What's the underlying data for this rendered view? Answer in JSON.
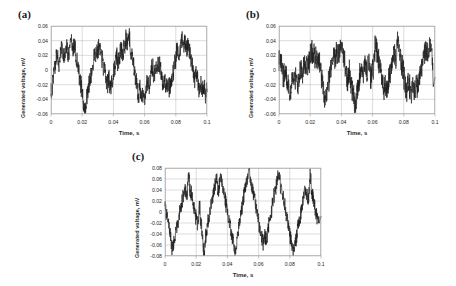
{
  "figure": {
    "background": "#ffffff",
    "line_color": "#1c1c1c",
    "grid_color": "#b8b8b8",
    "frame_color": "#9a9a9a",
    "text_color": "#2a2a2a"
  },
  "panels": [
    {
      "id": "a",
      "label": "(a)",
      "ylabel": "Generated voltage, mV",
      "xlabel": "Time, s",
      "yticks": [
        "0.06",
        "0.04",
        "0.02",
        "0",
        "-0.02",
        "-0.04",
        "-0.06"
      ],
      "xticks": [
        "0",
        "0.02",
        "0.04",
        "0.06",
        "0.08",
        "0.1"
      ]
    },
    {
      "id": "b",
      "label": "(b)",
      "ylabel": "Generated voltage, mV",
      "xlabel": "Time, s",
      "yticks": [
        "0.06",
        "0.04",
        "0.02",
        "0",
        "-0.02",
        "-0.04",
        "-0.06"
      ],
      "xticks": [
        "0",
        "0.02",
        "0.04",
        "0.06",
        "0.08",
        "0.1"
      ]
    },
    {
      "id": "c",
      "label": "(c)",
      "ylabel": "Generated voltage, mV",
      "xlabel": "Time, s",
      "yticks": [
        "0.08",
        "0.06",
        "0.04",
        "0.02",
        "0",
        "-0.02",
        "-0.04",
        "-0.06",
        "-0.08"
      ],
      "xticks": [
        "0",
        "0.02",
        "0.04",
        "0.06",
        "0.08",
        "0.1"
      ]
    }
  ],
  "chart_data": [
    {
      "type": "line",
      "panel": "a",
      "title": "(a)",
      "xlabel": "Time, s",
      "ylabel": "Generated voltage, mV",
      "xlim": [
        0,
        0.1
      ],
      "ylim": [
        -0.06,
        0.06
      ],
      "xticks": [
        0,
        0.02,
        0.04,
        0.06,
        0.08,
        0.1
      ],
      "yticks": [
        -0.06,
        -0.04,
        -0.02,
        0,
        0.02,
        0.04,
        0.06
      ],
      "grid": true,
      "legend": "none",
      "series": [
        {
          "name": "generated voltage",
          "description": "Noisy quasi-periodic waveform, about 7 cycles over 0.1 s (~70 Hz envelope), amplitude roughly +/-0.045 mV with high-frequency noise superimposed.",
          "sample_rate_hz": 2000,
          "envelope_frequency_hz": 70,
          "envelope_amplitude_mv": 0.026,
          "noise_amplitude_mv": 0.016,
          "peak_max_mv": 0.047,
          "peak_min_mv": -0.055,
          "x": [
            0.0,
            0.001,
            0.002,
            0.003,
            0.004,
            0.005,
            0.006,
            0.007,
            0.008,
            0.009,
            0.01,
            0.011,
            0.012,
            0.013,
            0.014,
            0.015,
            0.016,
            0.017,
            0.018,
            0.019,
            0.02,
            0.021,
            0.022,
            0.023,
            0.024,
            0.025,
            0.026,
            0.027,
            0.028,
            0.029,
            0.03,
            0.031,
            0.032,
            0.033,
            0.034,
            0.035,
            0.036,
            0.037,
            0.038,
            0.039,
            0.04,
            0.041,
            0.042,
            0.043,
            0.044,
            0.045,
            0.046,
            0.047,
            0.048,
            0.049,
            0.05,
            0.051,
            0.052,
            0.053,
            0.054,
            0.055,
            0.056,
            0.057,
            0.058,
            0.059,
            0.06,
            0.061,
            0.062,
            0.063,
            0.064,
            0.065,
            0.066,
            0.067,
            0.068,
            0.069,
            0.07,
            0.071,
            0.072,
            0.073,
            0.074,
            0.075,
            0.076,
            0.077,
            0.078,
            0.079,
            0.08,
            0.081,
            0.082,
            0.083,
            0.084,
            0.085,
            0.086,
            0.087,
            0.088,
            0.089,
            0.09,
            0.091,
            0.092,
            0.093,
            0.094,
            0.095,
            0.096,
            0.097,
            0.098,
            0.099,
            0.1
          ],
          "y": [
            -0.03,
            -0.018,
            -0.004,
            0.012,
            0.02,
            0.008,
            0.022,
            0.03,
            0.018,
            0.026,
            0.032,
            0.022,
            0.03,
            0.04,
            0.028,
            0.034,
            0.022,
            0.01,
            -0.004,
            -0.018,
            -0.03,
            -0.046,
            -0.055,
            -0.04,
            -0.026,
            -0.014,
            -0.002,
            0.01,
            0.022,
            0.018,
            0.028,
            0.032,
            0.02,
            0.012,
            0.002,
            -0.01,
            -0.02,
            -0.012,
            -0.024,
            -0.016,
            -0.006,
            0.006,
            0.018,
            0.01,
            0.022,
            0.03,
            0.02,
            0.034,
            0.042,
            0.036,
            0.047,
            0.03,
            0.018,
            0.006,
            -0.008,
            -0.02,
            -0.034,
            -0.026,
            -0.04,
            -0.03,
            -0.042,
            -0.026,
            -0.014,
            -0.022,
            -0.008,
            0.004,
            -0.006,
            0.008,
            0.0,
            0.01,
            0.002,
            -0.01,
            -0.02,
            -0.012,
            -0.024,
            -0.016,
            -0.026,
            -0.018,
            -0.008,
            0.004,
            0.016,
            0.028,
            0.02,
            0.034,
            0.042,
            0.03,
            0.038,
            0.026,
            0.034,
            0.022,
            0.012,
            0.0,
            -0.012,
            -0.004,
            -0.016,
            -0.026,
            -0.018,
            -0.03,
            -0.022,
            -0.034,
            -0.026
          ]
        }
      ]
    },
    {
      "type": "line",
      "panel": "b",
      "title": "(b)",
      "xlabel": "Time, s",
      "ylabel": "Generated voltage, mV",
      "xlim": [
        0,
        0.1
      ],
      "ylim": [
        -0.06,
        0.06
      ],
      "xticks": [
        0,
        0.02,
        0.04,
        0.06,
        0.08,
        0.1
      ],
      "yticks": [
        -0.06,
        -0.04,
        -0.02,
        0,
        0.02,
        0.04,
        0.06
      ],
      "grid": true,
      "legend": "none",
      "series": [
        {
          "name": "generated voltage",
          "description": "Predominantly random noise with no strong periodicity; amplitude mostly within +/-0.025 mV, occasional spikes to about +0.040 and -0.047 mV.",
          "sample_rate_hz": 2000,
          "envelope_frequency_hz": 0,
          "envelope_amplitude_mv": 0.006,
          "noise_amplitude_mv": 0.02,
          "peak_max_mv": 0.04,
          "peak_min_mv": -0.047,
          "x": [
            0.0,
            0.001,
            0.002,
            0.003,
            0.004,
            0.005,
            0.006,
            0.007,
            0.008,
            0.009,
            0.01,
            0.011,
            0.012,
            0.013,
            0.014,
            0.015,
            0.016,
            0.017,
            0.018,
            0.019,
            0.02,
            0.021,
            0.022,
            0.023,
            0.024,
            0.025,
            0.026,
            0.027,
            0.028,
            0.029,
            0.03,
            0.031,
            0.032,
            0.033,
            0.034,
            0.035,
            0.036,
            0.037,
            0.038,
            0.039,
            0.04,
            0.041,
            0.042,
            0.043,
            0.044,
            0.045,
            0.046,
            0.047,
            0.048,
            0.049,
            0.05,
            0.051,
            0.052,
            0.053,
            0.054,
            0.055,
            0.056,
            0.057,
            0.058,
            0.059,
            0.06,
            0.061,
            0.062,
            0.063,
            0.064,
            0.065,
            0.066,
            0.067,
            0.068,
            0.069,
            0.07,
            0.071,
            0.072,
            0.073,
            0.074,
            0.075,
            0.076,
            0.077,
            0.078,
            0.079,
            0.08,
            0.081,
            0.082,
            0.083,
            0.084,
            0.085,
            0.086,
            0.087,
            0.088,
            0.089,
            0.09,
            0.091,
            0.092,
            0.093,
            0.094,
            0.095,
            0.096,
            0.097,
            0.098,
            0.099,
            0.1
          ],
          "y": [
            0.01,
            0.016,
            0.004,
            -0.008,
            0.002,
            -0.012,
            -0.02,
            -0.032,
            -0.014,
            -0.004,
            -0.016,
            -0.006,
            -0.02,
            -0.008,
            0.004,
            -0.006,
            0.008,
            0.0,
            0.012,
            0.004,
            0.02,
            0.026,
            0.014,
            0.022,
            0.01,
            0.018,
            0.006,
            -0.008,
            -0.02,
            -0.034,
            -0.04,
            -0.026,
            -0.014,
            -0.002,
            0.01,
            0.02,
            0.012,
            0.026,
            0.018,
            0.03,
            0.037,
            0.024,
            0.012,
            0.0,
            -0.012,
            -0.004,
            -0.016,
            -0.028,
            -0.04,
            -0.047,
            -0.03,
            -0.018,
            -0.006,
            0.004,
            -0.006,
            0.006,
            -0.004,
            0.008,
            0.0,
            -0.01,
            0.002,
            0.012,
            0.04,
            0.022,
            0.01,
            -0.002,
            -0.014,
            -0.026,
            -0.018,
            -0.03,
            -0.02,
            -0.008,
            0.004,
            0.016,
            0.024,
            0.012,
            0.039,
            0.026,
            0.014,
            0.004,
            -0.008,
            -0.018,
            -0.028,
            -0.016,
            -0.026,
            -0.034,
            -0.022,
            -0.03,
            -0.018,
            -0.026,
            -0.014,
            -0.002,
            0.01,
            0.02,
            0.03,
            0.02,
            0.032,
            0.038,
            0.024,
            -0.01
          ]
        }
      ]
    },
    {
      "type": "line",
      "panel": "c",
      "title": "(c)",
      "xlabel": "Time, s",
      "ylabel": "Generated voltage, mV",
      "xlim": [
        0,
        0.1
      ],
      "ylim": [
        -0.08,
        0.08
      ],
      "xticks": [
        0,
        0.02,
        0.04,
        0.06,
        0.08,
        0.1
      ],
      "yticks": [
        -0.08,
        -0.06,
        -0.04,
        -0.02,
        0,
        0.02,
        0.04,
        0.06,
        0.08
      ],
      "grid": true,
      "legend": "none",
      "series": [
        {
          "name": "generated voltage",
          "description": "Strongly periodic noisy waveform, about 5 cycles over 0.1 s (50 Hz), amplitude roughly +/-0.065 mV with sharp peaks reaching 0.078 and troughs to -0.078 mV.",
          "sample_rate_hz": 2000,
          "envelope_frequency_hz": 50,
          "envelope_amplitude_mv": 0.042,
          "noise_amplitude_mv": 0.018,
          "peak_max_mv": 0.078,
          "peak_min_mv": -0.078,
          "x": [
            0.0,
            0.001,
            0.002,
            0.003,
            0.004,
            0.005,
            0.006,
            0.007,
            0.008,
            0.009,
            0.01,
            0.011,
            0.012,
            0.013,
            0.014,
            0.015,
            0.016,
            0.017,
            0.018,
            0.019,
            0.02,
            0.021,
            0.022,
            0.023,
            0.024,
            0.025,
            0.026,
            0.027,
            0.028,
            0.029,
            0.03,
            0.031,
            0.032,
            0.033,
            0.034,
            0.035,
            0.036,
            0.037,
            0.038,
            0.039,
            0.04,
            0.041,
            0.042,
            0.043,
            0.044,
            0.045,
            0.046,
            0.047,
            0.048,
            0.049,
            0.05,
            0.051,
            0.052,
            0.053,
            0.054,
            0.055,
            0.056,
            0.057,
            0.058,
            0.059,
            0.06,
            0.061,
            0.062,
            0.063,
            0.064,
            0.065,
            0.066,
            0.067,
            0.068,
            0.069,
            0.07,
            0.071,
            0.072,
            0.073,
            0.074,
            0.075,
            0.076,
            0.077,
            0.078,
            0.079,
            0.08,
            0.081,
            0.082,
            0.083,
            0.084,
            0.085,
            0.086,
            0.087,
            0.088,
            0.089,
            0.09,
            0.091,
            0.092,
            0.093,
            0.094,
            0.095,
            0.096,
            0.097,
            0.098,
            0.099,
            0.1
          ],
          "y": [
            0.006,
            -0.004,
            -0.018,
            -0.03,
            -0.055,
            -0.065,
            -0.05,
            -0.038,
            -0.024,
            -0.01,
            0.006,
            0.02,
            0.034,
            0.04,
            0.028,
            0.066,
            0.042,
            0.03,
            0.016,
            0.002,
            -0.012,
            -0.024,
            0.01,
            -0.02,
            -0.04,
            -0.078,
            -0.05,
            -0.03,
            -0.012,
            0.006,
            0.022,
            0.036,
            0.048,
            0.066,
            0.04,
            0.052,
            0.062,
            0.044,
            0.03,
            0.016,
            0.0,
            -0.016,
            -0.03,
            -0.046,
            -0.06,
            -0.072,
            -0.052,
            -0.034,
            -0.016,
            0.002,
            0.018,
            0.034,
            0.05,
            0.062,
            0.078,
            0.056,
            0.044,
            0.03,
            0.014,
            -0.002,
            -0.018,
            -0.032,
            -0.046,
            -0.056,
            -0.044,
            -0.05,
            -0.034,
            -0.018,
            0.0,
            0.016,
            0.03,
            0.044,
            0.056,
            0.064,
            0.05,
            0.036,
            0.022,
            0.006,
            -0.01,
            -0.026,
            -0.042,
            -0.056,
            -0.066,
            -0.062,
            -0.05,
            -0.034,
            -0.018,
            -0.002,
            0.014,
            0.028,
            0.04,
            0.03,
            0.022,
            0.066,
            0.04,
            0.024,
            0.01,
            -0.004,
            -0.014,
            -0.008
          ]
        }
      ]
    }
  ]
}
